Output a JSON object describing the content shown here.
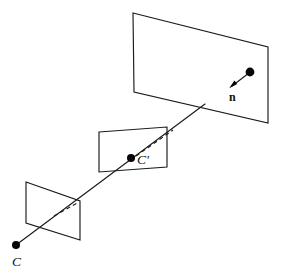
{
  "figure": {
    "background_color": "#ffffff",
    "stroke_color": "#1a1a1a",
    "dot_color": "#050505",
    "width": 283,
    "height": 272
  },
  "labels": {
    "camera_center": "C",
    "camera_center_prime": "C'",
    "normal_vector": "n"
  },
  "planes": [
    {
      "name": "near-image-plane",
      "points": "26,182 80,201 80,240 26,223",
      "label": ""
    },
    {
      "name": "middle-image-plane",
      "points": "99,132 167,127 167,167 99,172",
      "label": ""
    },
    {
      "name": "far-image-plane",
      "points": "133,13 268,47 268,123 134,92",
      "label": ""
    }
  ],
  "rays": {
    "solid_main": "16,245 205,104",
    "solid_normal": "250,72 231,86",
    "dashed_near": "54,216 79,202",
    "dashed_middle": "135,157 172,131"
  },
  "dots": [
    {
      "name": "dot-camera-center",
      "cx": 16,
      "cy": 245,
      "r": 4.0
    },
    {
      "name": "dot-camera-center-prime",
      "cx": 131,
      "cy": 158,
      "r": 4.0
    },
    {
      "name": "dot-normal-origin",
      "cx": 250,
      "cy": 72,
      "r": 4.4
    }
  ],
  "label_positions": {
    "camera_center": {
      "x": 12,
      "y": 264
    },
    "camera_center_prime": {
      "x": 137,
      "y": 163
    },
    "normal_vector": {
      "x": 229,
      "y": 100
    }
  }
}
